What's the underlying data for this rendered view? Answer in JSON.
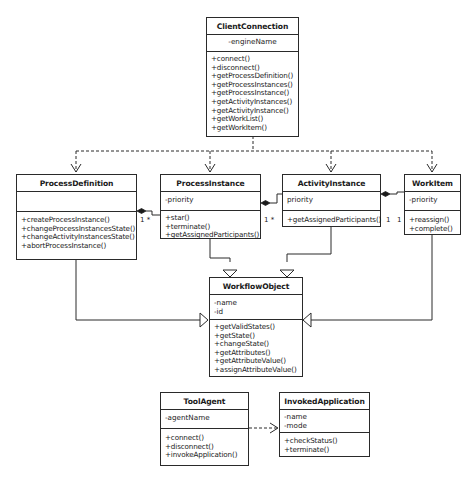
{
  "diagram": {
    "type": "UML class diagram",
    "classes": {
      "client_connection": {
        "name": "ClientConnection",
        "attributes": [
          "-engineName"
        ],
        "operations": [
          "+connect()",
          "+disconnect()",
          "+getProcessDefinition()",
          "+getProcessInstances()",
          "+getProcessInstance()",
          "+getActivityInstances()",
          "+getActivityInstance()",
          "+getWorkList()",
          "+getWorkItem()"
        ]
      },
      "process_definition": {
        "name": "ProcessDefinition",
        "attributes": [],
        "operations": [
          "+createProcessInstance()",
          "+changeProcessInstancesState()",
          "+changeActivityInstancesState()",
          "+abortProcessInstance()"
        ]
      },
      "process_instance": {
        "name": "ProcessInstance",
        "attributes": [
          "-priority"
        ],
        "operations": [
          "+star()",
          "+terminate()",
          "+getAssignedParticipants()"
        ]
      },
      "activity_instance": {
        "name": "ActivityInstance",
        "attributes": [
          "priority"
        ],
        "operations": [
          "+getAssignedParticipants()"
        ]
      },
      "work_item": {
        "name": "WorkItem",
        "attributes": [
          "-priority"
        ],
        "operations": [
          "+reassign()",
          "+complete()"
        ]
      },
      "workflow_object": {
        "name": "WorkflowObject",
        "attributes": [
          "-name",
          "-id"
        ],
        "operations": [
          "+getValidStates()",
          "+getState()",
          "+changeState()",
          "+getAttributes()",
          "+getAttributeValue()",
          "+assignAttributeValue()"
        ]
      },
      "tool_agent": {
        "name": "ToolAgent",
        "attributes": [
          "-agentName"
        ],
        "operations": [
          "+connect()",
          "+disconnect()",
          "+invokeApplication()"
        ]
      },
      "invoked_application": {
        "name": "InvokedApplication",
        "attributes": [
          "-name",
          "-mode"
        ],
        "operations": [
          "+checkStatus()",
          "+terminate()"
        ]
      }
    },
    "multiplicities": {
      "pd_pi_left": "1",
      "pd_pi_right": "*",
      "pi_ai_left": "1",
      "pi_ai_right": "*",
      "ai_wi_left": "1",
      "ai_wi_right": "1"
    },
    "relationships": [
      {
        "type": "dependency",
        "from": "ClientConnection",
        "to": "ProcessDefinition"
      },
      {
        "type": "dependency",
        "from": "ClientConnection",
        "to": "ProcessInstance"
      },
      {
        "type": "dependency",
        "from": "ClientConnection",
        "to": "ActivityInstance"
      },
      {
        "type": "dependency",
        "from": "ClientConnection",
        "to": "WorkItem"
      },
      {
        "type": "composition",
        "whole": "ProcessDefinition",
        "part": "ProcessInstance"
      },
      {
        "type": "composition",
        "whole": "ProcessInstance",
        "part": "ActivityInstance"
      },
      {
        "type": "composition",
        "whole": "ActivityInstance",
        "part": "WorkItem"
      },
      {
        "type": "generalization",
        "from": "ProcessDefinition",
        "to": "WorkflowObject"
      },
      {
        "type": "generalization",
        "from": "ProcessInstance",
        "to": "WorkflowObject"
      },
      {
        "type": "generalization",
        "from": "ActivityInstance",
        "to": "WorkflowObject"
      },
      {
        "type": "generalization",
        "from": "WorkItem",
        "to": "WorkflowObject"
      },
      {
        "type": "dependency",
        "from": "ToolAgent",
        "to": "InvokedApplication"
      }
    ],
    "colors": {
      "line": "#2a2a2a",
      "background": "#ffffff"
    }
  }
}
